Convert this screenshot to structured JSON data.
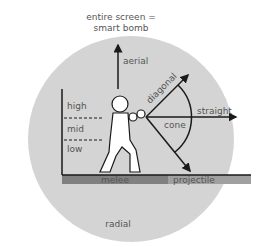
{
  "title_line1": "entire screen =",
  "title_line2": "smart bomb",
  "labels": {
    "aerial": "aerial",
    "diagonal": "diagonal",
    "straight": "straight",
    "cone": "cone",
    "high": "high",
    "mid": "mid",
    "low": "low",
    "melee": "melee",
    "projectile": "projectile",
    "radial": "radial"
  },
  "colors": {
    "circle": "#d4d4d4",
    "melee_bar": "#808080",
    "projectile_bar": "#a0a0a0",
    "line": "#1a1a1a",
    "text": "#555555"
  }
}
